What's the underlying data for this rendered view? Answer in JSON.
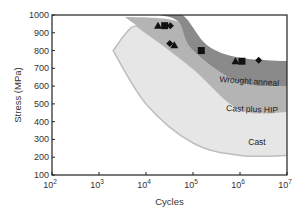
{
  "chart_data": {
    "type": "area",
    "title": "",
    "xlabel": "Cycles",
    "ylabel": "Stress (MPa)",
    "xscale": "log",
    "xlim": [
      100,
      10000000
    ],
    "ylim": [
      100,
      1000
    ],
    "x_ticks": [
      "10^2",
      "10^3",
      "10^4",
      "10^5",
      "10^6",
      "10^7"
    ],
    "x_tick_labels": [
      {
        "base": "10",
        "exp": "2"
      },
      {
        "base": "10",
        "exp": "3"
      },
      {
        "base": "10",
        "exp": "4"
      },
      {
        "base": "10",
        "exp": "5"
      },
      {
        "base": "10",
        "exp": "6"
      },
      {
        "base": "10",
        "exp": "7"
      }
    ],
    "y_ticks": [
      "100",
      "200",
      "300",
      "400",
      "500",
      "600",
      "700",
      "800",
      "900",
      "1000"
    ],
    "grid": false,
    "legend": "none (bands labeled inline)",
    "bands": [
      {
        "name": "Cast",
        "label": "Cast",
        "color": "#e6e6e6",
        "upper": [
          [
            2000,
            800
          ],
          [
            5000,
            930
          ],
          [
            10000,
            900
          ],
          [
            100000,
            700
          ],
          [
            1000000,
            470
          ],
          [
            10000000,
            460
          ]
        ],
        "lower": [
          [
            2000,
            800
          ],
          [
            10000,
            500
          ],
          [
            100000,
            280
          ],
          [
            1000000,
            210
          ],
          [
            10000000,
            210
          ]
        ]
      },
      {
        "name": "Cast plus HIP",
        "label": "Cast plus HIP",
        "color": "#b4b4b4",
        "upper": [
          [
            3500,
            990
          ],
          [
            50000,
            960
          ],
          [
            100000,
            800
          ],
          [
            1000000,
            620
          ],
          [
            10000000,
            600
          ]
        ],
        "lower": [
          [
            3500,
            990
          ],
          [
            10000,
            900
          ],
          [
            100000,
            700
          ],
          [
            1000000,
            470
          ],
          [
            10000000,
            460
          ]
        ]
      },
      {
        "name": "Wrought anneal",
        "label": "Wrought anneal",
        "color": "#8a8a8a",
        "upper": [
          [
            20000,
            1000
          ],
          [
            60000,
            1000
          ],
          [
            200000,
            830
          ],
          [
            1000000,
            760
          ],
          [
            10000000,
            740
          ]
        ],
        "lower": [
          [
            20000,
            1000
          ],
          [
            50000,
            960
          ],
          [
            100000,
            800
          ],
          [
            1000000,
            620
          ],
          [
            10000000,
            600
          ]
        ]
      }
    ],
    "series": [
      {
        "name": "triangles",
        "marker": "triangle",
        "points": [
          [
            18000,
            940
          ],
          [
            40000,
            830
          ],
          [
            800000,
            740
          ]
        ]
      },
      {
        "name": "squares",
        "marker": "square",
        "points": [
          [
            25000,
            940
          ],
          [
            150000,
            800
          ],
          [
            1100000,
            740
          ]
        ]
      },
      {
        "name": "diamonds",
        "marker": "diamond",
        "points": [
          [
            33000,
            940
          ],
          [
            32000,
            840
          ],
          [
            2500000,
            745
          ]
        ]
      }
    ],
    "annotations": [
      "Wrought anneal",
      "Cast plus HIP",
      "Cast"
    ]
  }
}
